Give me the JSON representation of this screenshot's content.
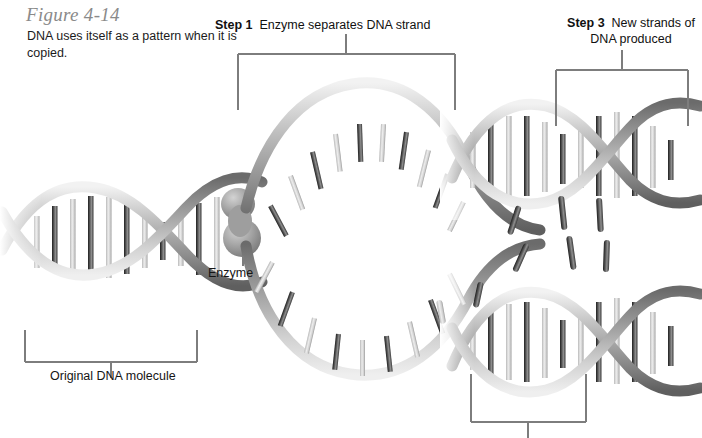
{
  "figure": {
    "number": "Figure 4-14",
    "caption": "DNA uses itself as a pattern when it is copied."
  },
  "steps": {
    "step1": {
      "number": "Step 1",
      "text": "Enzyme separates DNA strand"
    },
    "step3": {
      "number": "Step 3",
      "line1": "New strands of",
      "line2": "DNA produced"
    }
  },
  "labels": {
    "enzyme": "Enzyme",
    "original": "Original DNA molecule"
  },
  "colors": {
    "title_gray": "#8a8a8a",
    "text_black": "#151515",
    "leader_line": "#7d7d7d",
    "backbone_dark": "#6e6e6e",
    "backbone_light": "#d8d8d8",
    "base_dark": "#2c2c2c",
    "base_light": "#cfcfcf",
    "enzyme_gray": "#9a9a9a",
    "background": "#ffffff"
  },
  "diagram": {
    "type": "dna-replication-illustration",
    "elements": [
      "original-dna-helix",
      "enzyme-blob",
      "replication-bubble",
      "free-nucleotides",
      "new-dna-helix-top",
      "new-dna-helix-bottom"
    ],
    "free_nucleotide_count": 6
  }
}
